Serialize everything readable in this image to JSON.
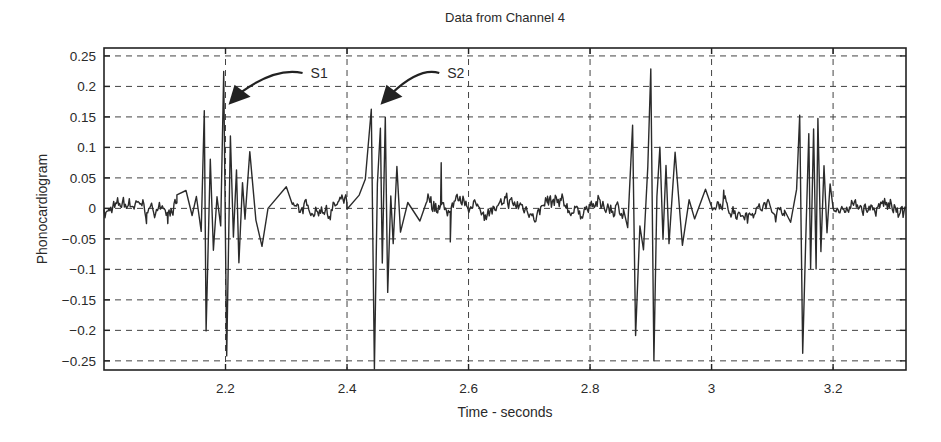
{
  "chart_data": {
    "type": "line",
    "title": "Data from Channel 4",
    "xlabel": "Time - seconds",
    "ylabel": "Phonocardiogram",
    "xlim": [
      2.0,
      3.32
    ],
    "ylim": [
      -0.265,
      0.263
    ],
    "grid": true,
    "grid_style": "dashed",
    "legend": null,
    "x_ticks": [
      2.2,
      2.4,
      2.6,
      2.8,
      3.0,
      3.2
    ],
    "x_tick_labels": [
      "2.2",
      "2.4",
      "2.6",
      "2.8",
      "3",
      "3.2"
    ],
    "y_ticks": [
      0.25,
      0.2,
      0.15,
      0.1,
      0.05,
      0,
      -0.05,
      -0.1,
      -0.15,
      -0.2,
      -0.25
    ],
    "y_tick_labels": [
      "0.25",
      "0.2",
      "0.15",
      "0.1",
      "0.05",
      "0",
      "−0.05",
      "−0.1",
      "−0.15",
      "−0.2",
      "−0.25"
    ],
    "series": [
      {
        "name": "Phonocardiogram signal",
        "color": "#2b2b2b",
        "baseline_noise_amplitude": 0.012,
        "key_points": [
          {
            "x": 2.13,
            "y": 0.03
          },
          {
            "x": 2.165,
            "y": 0.16
          },
          {
            "x": 2.168,
            "y": -0.2
          },
          {
            "x": 2.197,
            "y": 0.225
          },
          {
            "x": 2.202,
            "y": -0.24
          },
          {
            "x": 2.21,
            "y": 0.12
          },
          {
            "x": 2.22,
            "y": 0.09
          },
          {
            "x": 2.24,
            "y": 0.095
          },
          {
            "x": 2.3,
            "y": 0.035
          },
          {
            "x": 2.39,
            "y": 0.03
          },
          {
            "x": 2.44,
            "y": 0.16
          },
          {
            "x": 2.445,
            "y": -0.265
          },
          {
            "x": 2.455,
            "y": 0.13
          },
          {
            "x": 2.463,
            "y": 0.15
          },
          {
            "x": 2.48,
            "y": 0.07
          },
          {
            "x": 2.57,
            "y": -0.05
          },
          {
            "x": 2.87,
            "y": 0.135
          },
          {
            "x": 2.875,
            "y": -0.21
          },
          {
            "x": 2.9,
            "y": 0.23
          },
          {
            "x": 2.905,
            "y": -0.25
          },
          {
            "x": 2.915,
            "y": 0.1
          },
          {
            "x": 2.925,
            "y": 0.07
          },
          {
            "x": 2.94,
            "y": 0.09
          },
          {
            "x": 2.99,
            "y": 0.03
          },
          {
            "x": 3.145,
            "y": 0.15
          },
          {
            "x": 3.15,
            "y": -0.24
          },
          {
            "x": 3.165,
            "y": 0.12
          },
          {
            "x": 3.173,
            "y": 0.15
          },
          {
            "x": 3.185,
            "y": 0.07
          },
          {
            "x": 3.23,
            "y": 0.03
          }
        ]
      }
    ],
    "bursts": [
      {
        "label": "S1",
        "center": 2.2,
        "oscillations": [
          [
            2.12,
            0.02
          ],
          [
            2.135,
            0.03
          ],
          [
            2.145,
            -0.01
          ],
          [
            2.152,
            0.02
          ],
          [
            2.16,
            -0.04
          ],
          [
            2.165,
            0.16
          ],
          [
            2.168,
            -0.2
          ],
          [
            2.175,
            0.08
          ],
          [
            2.18,
            -0.07
          ],
          [
            2.186,
            0.02
          ],
          [
            2.192,
            -0.03
          ],
          [
            2.197,
            0.225
          ],
          [
            2.202,
            -0.24
          ],
          [
            2.208,
            0.12
          ],
          [
            2.213,
            -0.05
          ],
          [
            2.218,
            0.06
          ],
          [
            2.222,
            -0.09
          ],
          [
            2.228,
            0.04
          ],
          [
            2.232,
            -0.02
          ],
          [
            2.24,
            0.095
          ],
          [
            2.25,
            -0.02
          ],
          [
            2.26,
            -0.06
          ],
          [
            2.27,
            0.0
          ],
          [
            2.3,
            0.035
          ],
          [
            2.31,
            0.005
          ]
        ]
      },
      {
        "label": "S2",
        "center": 2.45,
        "oscillations": [
          [
            2.4,
            0.0
          ],
          [
            2.42,
            0.02
          ],
          [
            2.43,
            0.05
          ],
          [
            2.44,
            0.16
          ],
          [
            2.445,
            -0.265
          ],
          [
            2.45,
            0.04
          ],
          [
            2.455,
            0.13
          ],
          [
            2.458,
            -0.09
          ],
          [
            2.463,
            0.15
          ],
          [
            2.467,
            -0.14
          ],
          [
            2.472,
            0.02
          ],
          [
            2.476,
            -0.06
          ],
          [
            2.482,
            0.07
          ],
          [
            2.488,
            -0.04
          ],
          [
            2.5,
            0.01
          ],
          [
            2.52,
            -0.02
          ],
          [
            2.53,
            0.01
          ]
        ]
      },
      {
        "label": "",
        "center": 2.9,
        "oscillations": [
          [
            2.855,
            0.0
          ],
          [
            2.862,
            -0.03
          ],
          [
            2.87,
            0.135
          ],
          [
            2.875,
            -0.21
          ],
          [
            2.882,
            -0.03
          ],
          [
            2.888,
            -0.07
          ],
          [
            2.895,
            0.07
          ],
          [
            2.9,
            0.23
          ],
          [
            2.905,
            -0.25
          ],
          [
            2.91,
            0.02
          ],
          [
            2.915,
            0.1
          ],
          [
            2.92,
            -0.05
          ],
          [
            2.925,
            0.07
          ],
          [
            2.93,
            -0.06
          ],
          [
            2.94,
            0.09
          ],
          [
            2.952,
            -0.06
          ],
          [
            2.963,
            0.015
          ],
          [
            2.972,
            -0.02
          ],
          [
            2.99,
            0.03
          ],
          [
            3.0,
            0.0
          ]
        ]
      },
      {
        "label": "",
        "center": 3.16,
        "oscillations": [
          [
            3.12,
            0.0
          ],
          [
            3.13,
            -0.02
          ],
          [
            3.14,
            0.03
          ],
          [
            3.145,
            0.15
          ],
          [
            3.15,
            -0.24
          ],
          [
            3.155,
            -0.05
          ],
          [
            3.16,
            0.12
          ],
          [
            3.163,
            -0.1
          ],
          [
            3.168,
            0.13
          ],
          [
            3.172,
            -0.1
          ],
          [
            3.175,
            0.15
          ],
          [
            3.18,
            -0.07
          ],
          [
            3.185,
            0.07
          ],
          [
            3.19,
            -0.04
          ],
          [
            3.195,
            0.04
          ],
          [
            3.2,
            0.0
          ]
        ]
      }
    ],
    "annotations": [
      {
        "text": "S1",
        "x": 2.34,
        "y": 0.222,
        "arrow_to": {
          "x": 2.205,
          "y": 0.17
        }
      },
      {
        "text": "S2",
        "x": 2.565,
        "y": 0.222,
        "arrow_to": {
          "x": 2.455,
          "y": 0.17
        }
      }
    ]
  }
}
